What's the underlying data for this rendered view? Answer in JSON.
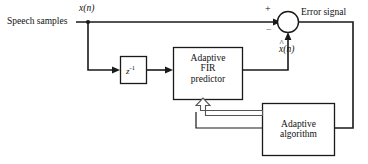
{
  "diagram": {
    "labels": {
      "input_source": "Speech samples",
      "input_signal": "x(n)",
      "input_signal_var": "x",
      "input_signal_arg": "(n)",
      "predicted_signal_var": "x",
      "predicted_signal_arg": "(n)",
      "predicted_signal_hat": "^",
      "predicted_signal": "x̂(n)",
      "error_signal": "Error signal",
      "plus_sign": "+",
      "minus_sign": "−"
    },
    "blocks": {
      "delay": {
        "name": "unit delay",
        "label_base": "z",
        "label_exponent": "-1"
      },
      "predictor": {
        "line1": "Adaptive",
        "line2": "FIR",
        "line3": "predictor"
      },
      "algorithm": {
        "line1": "Adaptive",
        "line2": "algorithm"
      }
    },
    "colors": {
      "line": "#1a1a1a",
      "fill": "#ffffff",
      "hollow_arrow_stroke": "#555555",
      "text": "#111111"
    }
  }
}
